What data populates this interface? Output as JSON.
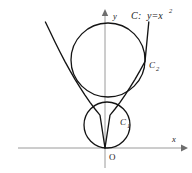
{
  "figure": {
    "background_color": "#ffffff",
    "curve_color": "#141414",
    "axis_color": "#9a9a9a",
    "label_color": "#1a1a1a"
  },
  "axes": {
    "x_label": "x",
    "y_label": "y",
    "origin_label": "O",
    "x_axis": {
      "x1": 18,
      "y1": 148,
      "x2": 183,
      "y2": 148,
      "arrow": "right"
    },
    "y_axis": {
      "x1": 105,
      "y1": 168,
      "x2": 105,
      "y2": 14,
      "arrow": "up"
    },
    "origin": {
      "x": 105,
      "y": 148
    }
  },
  "labels": {
    "curve_label": "C",
    "curve_separator": " : ",
    "curve_equation_base": "y=x",
    "curve_equation_exponent": "2",
    "circle_small_base": "C",
    "circle_small_sub": "1",
    "circle_large_base": "C",
    "circle_large_sub": "2"
  },
  "label_positions": {
    "curve": {
      "x": 131,
      "y": 17
    },
    "circle_large": {
      "x": 149,
      "y": 66
    },
    "circle_small": {
      "x": 120,
      "y": 123
    },
    "x_axis": {
      "x": 172,
      "y": 140
    },
    "y_axis": {
      "x": 113,
      "y": 17
    },
    "origin": {
      "x": 109,
      "y": 158
    }
  },
  "chart_data": {
    "type": "line",
    "xlabel": "x",
    "ylabel": "y",
    "grid": false,
    "legend": "none",
    "origin_label": "O",
    "series": [
      {
        "name": "C : y=x²",
        "kind": "parabola",
        "equation": "y = x^2",
        "vertex_px": [
          105,
          148
        ],
        "scale_px_per_unit_x": 42,
        "scale_px_per_unit_y": 42,
        "x_domain_units": [
          -1.42,
          1.05
        ],
        "points_px": [
          [
            45.4,
            22.0
          ],
          [
            50.0,
            31.5
          ],
          [
            55.0,
            42.0
          ],
          [
            60.0,
            52.0
          ],
          [
            65.0,
            61.6
          ],
          [
            70.0,
            70.7
          ],
          [
            75.0,
            79.3
          ],
          [
            80.0,
            87.4
          ],
          [
            85.0,
            95.1
          ],
          [
            90.0,
            102.3
          ],
          [
            95.0,
            109.0
          ],
          [
            100.0,
            115.2
          ],
          [
            105.0,
            148.0
          ],
          [
            110.0,
            115.2
          ],
          [
            115.0,
            109.0
          ],
          [
            120.0,
            102.3
          ],
          [
            125.0,
            95.1
          ],
          [
            130.0,
            87.4
          ],
          [
            135.0,
            79.3
          ],
          [
            140.0,
            70.7
          ],
          [
            145.0,
            61.6
          ],
          [
            148.8,
            22.0
          ]
        ]
      },
      {
        "name": "C₂",
        "kind": "circle",
        "center_px": [
          108,
          60
        ],
        "radius_px": 37,
        "description": "large circle tangent to parabola from inside"
      },
      {
        "name": "C₁",
        "kind": "circle",
        "center_px": [
          107,
          125
        ],
        "radius_px": 23,
        "description": "small circle tangent to parabola at the origin"
      }
    ]
  }
}
